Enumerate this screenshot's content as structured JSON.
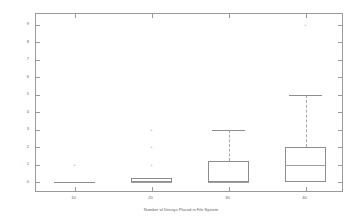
{
  "chart_data": {
    "type": "box",
    "title": "",
    "xlabel": "Number of Decoys Placed in File System",
    "ylabel": "Distribution of Decoy File Accesses by Legitimate Users",
    "categories": [
      "10",
      "20",
      "30",
      "40"
    ],
    "xtick_labels": [
      "10",
      "20",
      "30",
      "40"
    ],
    "ytick_labels": [
      "0",
      "1",
      "2",
      "3",
      "4",
      "5",
      "6",
      "7",
      "8",
      "9"
    ],
    "ylim": [
      -0.6,
      9.6
    ],
    "grid": false,
    "legend": null,
    "boxes": [
      {
        "category": "10",
        "whisker_low": 0,
        "q1": 0,
        "median": 0,
        "q3": 0,
        "whisker_high": 0,
        "outliers": [
          1
        ]
      },
      {
        "category": "20",
        "whisker_low": 0,
        "q1": 0,
        "median": 0,
        "q3": 0.25,
        "whisker_high": 0.25,
        "outliers": [
          1,
          2,
          3
        ]
      },
      {
        "category": "30",
        "whisker_low": 0,
        "q1": 0,
        "median": 0,
        "q3": 1.25,
        "whisker_high": 3,
        "outliers": []
      },
      {
        "category": "40",
        "whisker_low": 0,
        "q1": 0,
        "median": 1,
        "q3": 2,
        "whisker_high": 5,
        "outliers": [
          9
        ]
      }
    ]
  },
  "axis": {
    "y_axis_label": "Distribution of Decoy File Accesses by Legitimate Users",
    "x_axis_label": "Number of Decoys Placed in File System"
  },
  "colors": {
    "frame": "#9a9a9a",
    "box_outline": "#8d8d8d",
    "whisker": "#a8a8a8",
    "median": "#9e9e9e",
    "text": "#5f5f5f",
    "background": "#ffffff"
  }
}
